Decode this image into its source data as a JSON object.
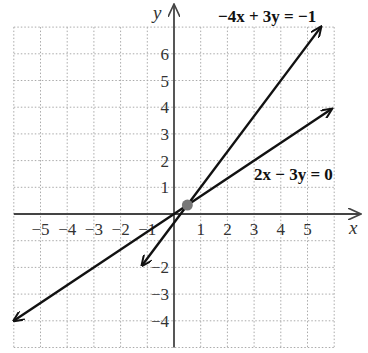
{
  "chart_data": {
    "type": "line",
    "title": "",
    "xlabel": "x",
    "ylabel": "y",
    "xlim": [
      -6,
      6
    ],
    "ylim": [
      -5,
      7
    ],
    "grid": true,
    "x_ticks": [
      "-5",
      "-4",
      "-3",
      "-2",
      "-1",
      "1",
      "2",
      "3",
      "4",
      "5"
    ],
    "y_ticks": [
      "6",
      "5",
      "4",
      "3",
      "2",
      "1",
      "-2",
      "-3",
      "-4"
    ],
    "series": [
      {
        "name": "-4x + 3y = -1",
        "label": "−4x + 3y = −1",
        "x": [
          -1.2,
          5.5
        ],
        "y": [
          -1.93,
          7.0
        ]
      },
      {
        "name": "2x - 3y = 0",
        "label": "2x − 3y = 0",
        "x": [
          -6.0,
          5.9
        ],
        "y": [
          -4.0,
          3.93
        ]
      }
    ],
    "intersection": {
      "x": 0.5,
      "y": 0.333,
      "color": "#777777"
    }
  },
  "labels": {
    "x_axis": "x",
    "y_axis": "y",
    "eq1": "−4x + 3y = −1",
    "eq2": "2x − 3y = 0"
  }
}
